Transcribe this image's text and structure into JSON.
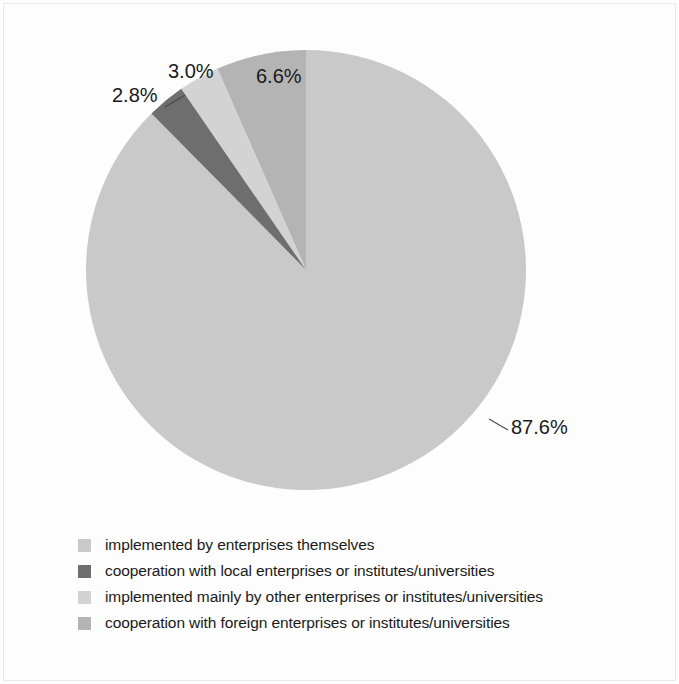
{
  "chart_data": {
    "type": "pie",
    "title": "",
    "subtitle": "",
    "xlabel": "",
    "ylabel": "",
    "grid": false,
    "legend_position": "bottom-left",
    "start_angle_deg": 0,
    "direction": "clockwise",
    "categories": [
      "implemented by enterprises themselves",
      "cooperation with local enterprises or institutes/universities",
      "implemented mainly by other enterprises or institutes/universities",
      "cooperation with foreign enterprises or institutes/universities"
    ],
    "values": [
      87.6,
      2.8,
      3.0,
      6.6
    ],
    "value_labels": [
      "87.6%",
      "2.8%",
      "3.0%",
      "6.6%"
    ],
    "colors": [
      "#c9c9c9",
      "#6e6e6e",
      "#d3d3d3",
      "#b4b4b4"
    ],
    "slices": [
      {
        "label": "implemented by enterprises themselves",
        "value": 87.6,
        "value_label": "87.6%",
        "color": "#c9c9c9"
      },
      {
        "label": "cooperation with foreign enterprises or institutes/universities",
        "value": 6.6,
        "value_label": "6.6%",
        "color": "#b4b4b4"
      },
      {
        "label": "implemented mainly by other enterprises or institutes/universities",
        "value": 3.0,
        "value_label": "3.0%",
        "color": "#d3d3d3"
      },
      {
        "label": "cooperation with local enterprises or institutes/universities",
        "value": 2.8,
        "value_label": "2.8%",
        "color": "#6e6e6e"
      }
    ]
  },
  "legend": {
    "items": [
      {
        "label": "implemented by enterprises themselves",
        "color": "#c9c9c9"
      },
      {
        "label": "cooperation with local enterprises or institutes/universities",
        "color": "#6e6e6e"
      },
      {
        "label": "implemented mainly by other enterprises or institutes/universities",
        "color": "#d3d3d3"
      },
      {
        "label": "cooperation with foreign enterprises or institutes/universities",
        "color": "#b4b4b4"
      }
    ]
  },
  "labels": {
    "main": "87.6%",
    "foreign": "6.6%",
    "other": "3.0%",
    "local": "2.8%"
  },
  "colors": {
    "background": "#fdfdfd",
    "text": "#1a1a1a",
    "leader": "#4a4a4a",
    "main_slice": "#c9c9c9",
    "local_slice": "#6e6e6e",
    "other_slice": "#d3d3d3",
    "foreign_slice": "#b4b4b4"
  }
}
